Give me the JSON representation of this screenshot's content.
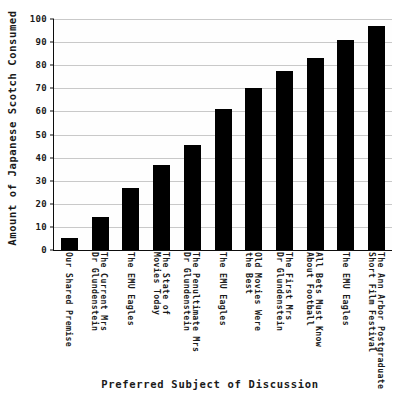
{
  "chart_data": {
    "type": "bar",
    "title": "",
    "xlabel": "Preferred Subject of Discussion",
    "ylabel": "Amount of Japanese Scotch Consumed",
    "ylim": [
      0,
      100
    ],
    "yticks": [
      0,
      10,
      20,
      30,
      40,
      50,
      60,
      70,
      80,
      90,
      100
    ],
    "ytick_labels": [
      "0",
      "10",
      "20",
      "30",
      "40",
      "50",
      "60",
      "70",
      "80",
      "90",
      "100"
    ],
    "grid": true,
    "legend": "none",
    "bar_color": "#000000",
    "categories": [
      "Our Shared Premise",
      "The Current Mrs\nDr Glundenstein",
      "The EMU Eagles",
      "The State of\nMovies Today",
      "The Penultimate Mrs\nDr Glundenstein",
      "The EMU Eagles",
      "Old Movies Were\nthe Best",
      "The First Mrs\nDr Glundenstein",
      "All Bets Must Know\nAbout Football",
      "The EMU Eagles",
      "The Ann Arbor Postgraduate\nShort Film Festival"
    ],
    "values": [
      5,
      14.5,
      27,
      37,
      45.5,
      61,
      70,
      77.5,
      83,
      91,
      97
    ]
  }
}
